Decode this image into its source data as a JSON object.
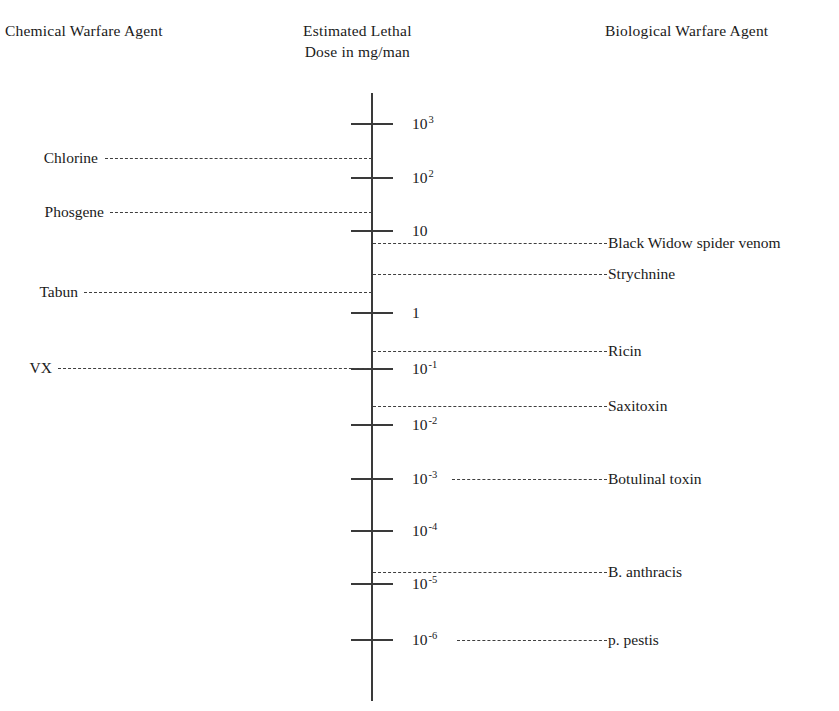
{
  "headers": {
    "left": "Chemical Warfare Agent",
    "center_line1": "Estimated Lethal",
    "center_line2": "Dose in mg/man",
    "right": "Biological Warfare Agent"
  },
  "axis": {
    "unit": "mg/man",
    "scale": "logarithmic",
    "tick_labels": [
      "10³",
      "10²",
      "10",
      "1",
      "10⁻¹",
      "10⁻²",
      "10⁻³",
      "10⁻⁴",
      "10⁻⁵",
      "10⁻⁶"
    ]
  },
  "ticks": [
    {
      "base": "10",
      "exp": "3",
      "value": 1000,
      "y": 124
    },
    {
      "base": "10",
      "exp": "2",
      "value": 100,
      "y": 178
    },
    {
      "base": "10",
      "exp": "",
      "value": 10,
      "y": 231
    },
    {
      "base": "1",
      "exp": "",
      "value": 1,
      "y": 313
    },
    {
      "base": "10",
      "exp": "-1",
      "value": 0.1,
      "y": 369
    },
    {
      "base": "10",
      "exp": "-2",
      "value": 0.01,
      "y": 425
    },
    {
      "base": "10",
      "exp": "-3",
      "value": 0.001,
      "y": 479
    },
    {
      "base": "10",
      "exp": "-4",
      "value": 0.0001,
      "y": 531
    },
    {
      "base": "10",
      "exp": "-5",
      "value": 1e-05,
      "y": 584
    },
    {
      "base": "10",
      "exp": "-6",
      "value": 1e-06,
      "y": 640
    }
  ],
  "chemical_agents": [
    {
      "name": "Chlorine",
      "y": 158,
      "label_right": 98,
      "dash_left": 105,
      "approx_dose_mg": 300
    },
    {
      "name": "Phosgene",
      "y": 212,
      "label_right": 104,
      "dash_left": 110,
      "approx_dose_mg": 30
    },
    {
      "name": "Tabun",
      "y": 292,
      "label_right": 78,
      "dash_left": 84,
      "approx_dose_mg": 2
    },
    {
      "name": "VX",
      "y": 368,
      "label_right": 52,
      "dash_left": 58,
      "approx_dose_mg": 0.1
    }
  ],
  "biological_agents": [
    {
      "name": "Black Widow spider venom",
      "y": 243,
      "label_left": 608,
      "dash_right": 607,
      "dash_left": 373,
      "approx_dose_mg": 5
    },
    {
      "name": "Strychnine",
      "y": 274,
      "label_left": 608,
      "dash_right": 607,
      "dash_left": 373,
      "approx_dose_mg": 3
    },
    {
      "name": "Ricin",
      "y": 351,
      "label_left": 608,
      "dash_right": 607,
      "dash_left": 373,
      "approx_dose_mg": 0.2
    },
    {
      "name": "Saxitoxin",
      "y": 406,
      "label_left": 608,
      "dash_right": 607,
      "dash_left": 373,
      "approx_dose_mg": 0.02
    },
    {
      "name": "Botulinal toxin",
      "y": 479,
      "label_left": 608,
      "dash_right": 607,
      "dash_left": 452,
      "approx_dose_mg": 0.001
    },
    {
      "name": "B. anthracis",
      "y": 572,
      "label_left": 608,
      "dash_right": 607,
      "dash_left": 373,
      "approx_dose_mg": 2e-05
    },
    {
      "name": "p. pestis",
      "y": 640,
      "label_left": 608,
      "dash_right": 607,
      "dash_left": 457,
      "approx_dose_mg": 1e-06
    }
  ],
  "chart_data": {
    "type": "scatter",
    "title": "Estimated Lethal Dose in mg/man",
    "xlabel": "",
    "ylabel": "Estimated Lethal Dose in mg/man",
    "yscale": "log",
    "ylim": [
      5e-07,
      3000
    ],
    "ytick_labels": [
      "10³",
      "10²",
      "10",
      "1",
      "10⁻¹",
      "10⁻²",
      "10⁻³",
      "10⁻⁴",
      "10⁻⁵",
      "10⁻⁶"
    ],
    "ytick_values": [
      1000,
      100,
      10,
      1,
      0.1,
      0.01,
      0.001,
      0.0001,
      1e-05,
      1e-06
    ],
    "grid": false,
    "legend": "none",
    "series": [
      {
        "name": "Chemical Warfare Agent",
        "side": "left",
        "categories": [
          "Chlorine",
          "Phosgene",
          "Tabun",
          "VX"
        ],
        "values": [
          300,
          30,
          2,
          0.1
        ]
      },
      {
        "name": "Biological Warfare Agent",
        "side": "right",
        "categories": [
          "Black Widow spider venom",
          "Strychnine",
          "Ricin",
          "Saxitoxin",
          "Botulinal toxin",
          "B. anthracis",
          "p. pestis"
        ],
        "values": [
          5,
          3,
          0.2,
          0.02,
          0.001,
          2e-05,
          1e-06
        ]
      }
    ]
  }
}
